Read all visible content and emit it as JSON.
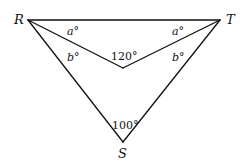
{
  "diagram": {
    "type": "geometry",
    "vertices": {
      "R": {
        "label": "R",
        "x": 28,
        "y": 20
      },
      "T": {
        "label": "T",
        "x": 220,
        "y": 20
      },
      "S": {
        "label": "S",
        "x": 123,
        "y": 142
      },
      "P": {
        "label": "",
        "x": 123,
        "y": 68
      }
    },
    "segments": [
      [
        "R",
        "T"
      ],
      [
        "R",
        "S"
      ],
      [
        "T",
        "S"
      ],
      [
        "R",
        "P"
      ],
      [
        "T",
        "P"
      ]
    ],
    "angle_labels": {
      "R_top": "a°",
      "T_top": "a°",
      "R_bottom": "b°",
      "T_bottom": "b°",
      "P": "120°",
      "S": "100°"
    },
    "colors": {
      "line": "#111111",
      "background": "#ffffff"
    }
  }
}
